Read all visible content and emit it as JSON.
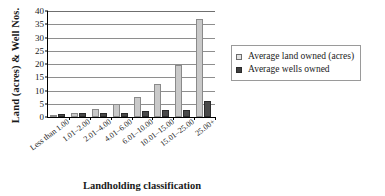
{
  "chart_data": {
    "type": "bar",
    "title": "",
    "xlabel": "Landholding classification",
    "ylabel": "Land (acres) & Well Nos.",
    "ylim": [
      0,
      40
    ],
    "ytick_step": 5,
    "yticks": [
      "0",
      "5",
      "10",
      "15",
      "20",
      "25",
      "30",
      "35",
      "40"
    ],
    "grid": true,
    "legend_position": "right",
    "categories": [
      "Less than 1.00",
      "1.01–2.00",
      "2.01–4.00",
      "4.01–6.00",
      "6.01–10.00",
      "10.01–15.00",
      "15.01–25.00",
      "25.00+"
    ],
    "series": [
      {
        "name": "Average land owned (acres)",
        "color": "#c9c9c9",
        "values": [
          0.7,
          1.6,
          3.1,
          5.0,
          7.6,
          12.3,
          19.8,
          37.1
        ]
      },
      {
        "name": "Average wells owned",
        "color": "#494949",
        "values": [
          1.2,
          1.5,
          1.5,
          1.5,
          2.3,
          2.5,
          2.6,
          5.9
        ]
      }
    ]
  },
  "legend": {
    "items": [
      {
        "label": "Average land owned (acres)",
        "swatch": "light"
      },
      {
        "label": "Average wells owned",
        "swatch": "dark"
      }
    ]
  }
}
